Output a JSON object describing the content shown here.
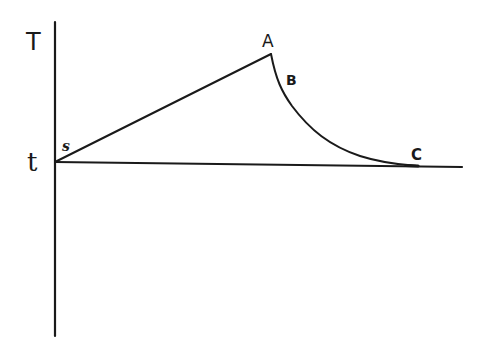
{
  "diagram": {
    "type": "line-sketch",
    "axes": {
      "vertical_label": "T",
      "horizontal_label": "t"
    },
    "points": {
      "s": "s",
      "A": "A",
      "B": "B",
      "C": "C"
    },
    "segments": [
      {
        "from": "s",
        "to": "A",
        "shape": "straight rising line"
      },
      {
        "from": "A",
        "to": "C",
        "shape": "decaying curve passing through B"
      }
    ],
    "stroke_color": "#1a1a1a",
    "background_color": "#ffffff"
  }
}
